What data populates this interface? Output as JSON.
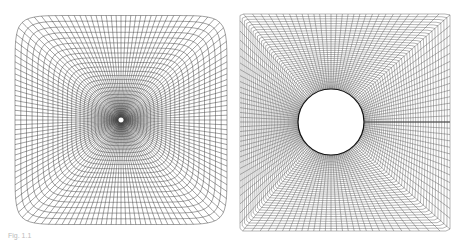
{
  "figure": {
    "caption": "Fig. 1.1",
    "panels": [
      {
        "id": "left",
        "label": "Square domain grid clustered toward central point",
        "x": 15,
        "y": 14,
        "w": 212,
        "h": 209,
        "center": [
          121,
          120
        ],
        "hole_radius": 3,
        "lines": 36
      },
      {
        "id": "right",
        "label": "O-type grid around circular cylinder with branch cut",
        "x": 240,
        "y": 14,
        "w": 210,
        "h": 217,
        "center": [
          331,
          122
        ],
        "hole_radius": 33,
        "lines": 60
      }
    ],
    "colors": {
      "grid": "#333333",
      "background": "#ffffff"
    }
  }
}
